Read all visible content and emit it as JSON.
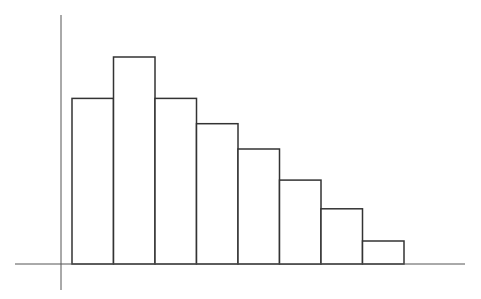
{
  "chart_data": {
    "type": "bar",
    "title": "",
    "xlabel": "",
    "ylabel": "",
    "categories": [
      "1",
      "2",
      "3",
      "4",
      "5",
      "6",
      "7",
      "8"
    ],
    "values": [
      7.2,
      9.0,
      7.2,
      6.1,
      5.0,
      3.65,
      2.4,
      1.0
    ],
    "ylim": [
      0,
      12
    ],
    "grid": false,
    "legend": null,
    "style": {
      "bar_fill": "#ffffff",
      "bar_stroke": "#333333",
      "axis_color": "#555555",
      "background": "#ffffff"
    }
  }
}
